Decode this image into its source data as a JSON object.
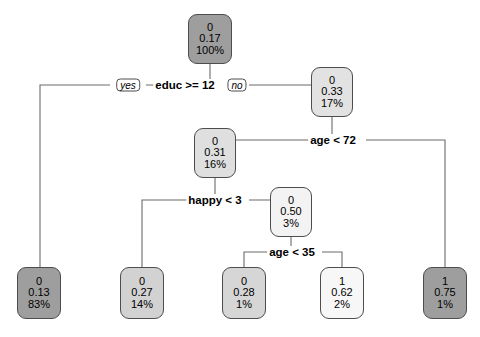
{
  "figure": {
    "type": "decision-tree",
    "width": 480,
    "height": 337,
    "background": "#ffffff",
    "node_border_color": "#4d4d4d",
    "edge_color": "#6b6b6b"
  },
  "chart_data": {
    "type": "tree",
    "title": "",
    "node_label_format": [
      "class",
      "probability",
      "percent"
    ],
    "nodes": [
      {
        "id": "root",
        "class": "0",
        "prob": "0.17",
        "percent": "100%",
        "fill": "#9e9e9e",
        "x": 188,
        "y": 14,
        "w": 44,
        "h": 50,
        "kind": "internal"
      },
      {
        "id": "n2",
        "class": "0",
        "prob": "0.33",
        "percent": "17%",
        "fill": "#e2e2e2",
        "x": 311,
        "y": 67,
        "w": 42,
        "h": 50,
        "kind": "internal"
      },
      {
        "id": "n3",
        "class": "0",
        "prob": "0.31",
        "percent": "16%",
        "fill": "#dfdfdf",
        "x": 194,
        "y": 128,
        "w": 42,
        "h": 50,
        "kind": "internal"
      },
      {
        "id": "n4",
        "class": "0",
        "prob": "0.50",
        "percent": "3%",
        "fill": "#f3f3f3",
        "x": 270,
        "y": 187,
        "w": 42,
        "h": 50,
        "kind": "leaf"
      },
      {
        "id": "n5",
        "class": "0",
        "prob": "0.13",
        "percent": "83%",
        "fill": "#9e9e9e",
        "x": 17,
        "y": 267,
        "w": 44,
        "h": 52,
        "kind": "leaf"
      },
      {
        "id": "n6",
        "class": "0",
        "prob": "0.27",
        "percent": "14%",
        "fill": "#d2d2d2",
        "x": 120,
        "y": 267,
        "w": 44,
        "h": 52,
        "kind": "leaf"
      },
      {
        "id": "n7",
        "class": "0",
        "prob": "0.28",
        "percent": "1%",
        "fill": "#d6d6d6",
        "x": 222,
        "y": 267,
        "w": 44,
        "h": 52,
        "kind": "leaf"
      },
      {
        "id": "n8",
        "class": "1",
        "prob": "0.62",
        "percent": "2%",
        "fill": "#f7f7f7",
        "x": 320,
        "y": 267,
        "w": 44,
        "h": 52,
        "kind": "leaf"
      },
      {
        "id": "n9",
        "class": "1",
        "prob": "0.75",
        "percent": "1%",
        "fill": "#9e9e9e",
        "x": 423,
        "y": 267,
        "w": 44,
        "h": 52,
        "kind": "leaf"
      }
    ],
    "splits": [
      {
        "id": "s1",
        "text": "educ >= 12",
        "x": 185,
        "y": 85
      },
      {
        "id": "s2",
        "text": "age < 72",
        "x": 333,
        "y": 140
      },
      {
        "id": "s3",
        "text": "happy < 3",
        "x": 215,
        "y": 200
      },
      {
        "id": "s4",
        "text": "age < 35",
        "x": 292,
        "y": 252
      }
    ],
    "branch_labels": [
      {
        "id": "yes1",
        "text": "yes",
        "x": 128,
        "y": 85
      },
      {
        "id": "no1",
        "text": "no",
        "x": 237,
        "y": 85
      }
    ],
    "edges": [
      {
        "from": "root",
        "to": "s1-yes",
        "points": "210,64 210,85 146,85"
      },
      {
        "from": "root",
        "to": "s1-no",
        "points": "210,64 210,85 225,85"
      },
      {
        "from": "s1-yes",
        "to": "n5",
        "points": "110,85 40,85 40,267"
      },
      {
        "from": "s1-no",
        "to": "n2",
        "points": "249,85 332,85 332,67"
      },
      {
        "from": "n2",
        "to": "s2",
        "points": "332,117 332,140 300,140"
      },
      {
        "from": "s2-left",
        "to": "n3",
        "points": "300,140 215,140 215,128"
      },
      {
        "from": "s2-right",
        "to": "n9",
        "points": "366,140 445,140 445,267"
      },
      {
        "from": "n3",
        "to": "s3",
        "points": "215,178 215,200 182,200"
      },
      {
        "from": "s3-left",
        "to": "n6",
        "points": "182,200 142,200 142,267"
      },
      {
        "from": "s3-right",
        "to": "n4",
        "points": "249,200 291,200 291,187"
      },
      {
        "from": "n4",
        "to": "s4",
        "points": "291,237 291,252 262,252"
      },
      {
        "from": "s4-left",
        "to": "n7",
        "points": "262,252 244,252 244,267"
      },
      {
        "from": "s4-right",
        "to": "n8",
        "points": "322,252 342,252 342,267"
      }
    ]
  },
  "corner_mark": {
    "text": ""
  }
}
